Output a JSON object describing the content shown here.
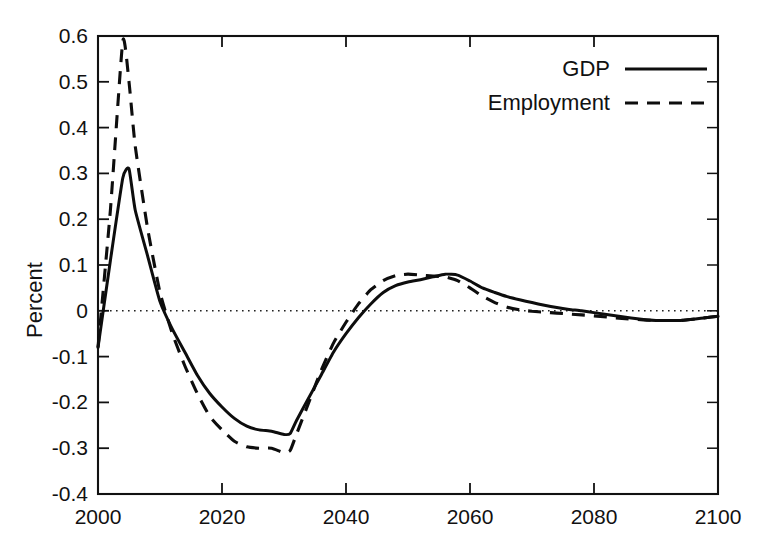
{
  "chart_data": {
    "type": "line",
    "title": "",
    "subtitle": "",
    "xlabel": "",
    "ylabel": "Percent",
    "xlim": [
      2000,
      2100
    ],
    "ylim": [
      -0.4,
      0.6
    ],
    "grid": false,
    "zero_reference_line": true,
    "legend_position": "top-right-inside",
    "x_ticks": [
      2000,
      2020,
      2040,
      2060,
      2080,
      2100
    ],
    "x_tick_labels": [
      "2000",
      "2020",
      "2040",
      "2060",
      "2080",
      "2100"
    ],
    "x_minor_ticks": [
      2010,
      2030,
      2050,
      2070,
      2090
    ],
    "y_ticks": [
      -0.4,
      -0.3,
      -0.2,
      -0.1,
      0,
      0.1,
      0.2,
      0.3,
      0.4,
      0.5,
      0.6
    ],
    "y_tick_labels": [
      "-0.4",
      "-0.3",
      "-0.2",
      "-0.1",
      "0",
      "0.1",
      "0.2",
      "0.3",
      "0.4",
      "0.5",
      "0.6"
    ],
    "x": [
      2000,
      2002,
      2004,
      2005,
      2006,
      2008,
      2010,
      2012,
      2014,
      2016,
      2018,
      2020,
      2022,
      2024,
      2026,
      2028,
      2030,
      2031,
      2032,
      2034,
      2036,
      2038,
      2040,
      2042,
      2044,
      2046,
      2048,
      2050,
      2052,
      2054,
      2056,
      2058,
      2060,
      2062,
      2064,
      2066,
      2068,
      2070,
      2072,
      2074,
      2076,
      2078,
      2080,
      2084,
      2088,
      2090,
      2094,
      2098,
      2100
    ],
    "series": [
      {
        "name": "GDP",
        "style": "solid",
        "color": "#0d0d0d",
        "values": [
          -0.08,
          0.11,
          0.29,
          0.31,
          0.22,
          0.12,
          0.02,
          -0.04,
          -0.09,
          -0.14,
          -0.18,
          -0.21,
          -0.235,
          -0.252,
          -0.26,
          -0.263,
          -0.27,
          -0.268,
          -0.24,
          -0.19,
          -0.14,
          -0.09,
          -0.05,
          -0.015,
          0.015,
          0.04,
          0.055,
          0.063,
          0.068,
          0.074,
          0.08,
          0.078,
          0.065,
          0.05,
          0.04,
          0.031,
          0.024,
          0.018,
          0.012,
          0.007,
          0.003,
          0.0,
          -0.004,
          -0.012,
          -0.019,
          -0.021,
          -0.021,
          -0.015,
          -0.012
        ]
      },
      {
        "name": "Employment",
        "style": "dashed",
        "color": "#0d0d0d",
        "values": [
          -0.08,
          0.22,
          0.59,
          0.5,
          0.36,
          0.18,
          0.04,
          -0.05,
          -0.12,
          -0.18,
          -0.23,
          -0.26,
          -0.285,
          -0.297,
          -0.3,
          -0.3,
          -0.31,
          -0.305,
          -0.27,
          -0.2,
          -0.13,
          -0.07,
          -0.025,
          0.015,
          0.046,
          0.066,
          0.077,
          0.08,
          0.078,
          0.076,
          0.074,
          0.066,
          0.05,
          0.032,
          0.018,
          0.008,
          0.002,
          -0.001,
          -0.003,
          -0.005,
          -0.007,
          -0.009,
          -0.011,
          -0.016,
          -0.02,
          -0.021,
          -0.021,
          -0.015,
          -0.012
        ]
      }
    ],
    "annotations": {
      "gdp_peak": {
        "x": 2005,
        "y": 0.31
      },
      "employment_peak": {
        "x": 2004,
        "y": 0.59
      },
      "gdp_trough": {
        "x": 2030,
        "y": -0.27
      },
      "employment_trough": {
        "x": 2030,
        "y": -0.31
      },
      "gdp_secondary_peak": {
        "x": 2056,
        "y": 0.08
      },
      "employment_secondary_peak": {
        "x": 2050,
        "y": 0.08
      }
    }
  },
  "legend": {
    "items": [
      {
        "label": "GDP",
        "style": "solid"
      },
      {
        "label": "Employment",
        "style": "dashed"
      }
    ]
  },
  "axes": {
    "y_title": "Percent"
  },
  "colors": {
    "line": "#0d0d0d",
    "axis": "#111111",
    "background": "#ffffff"
  }
}
